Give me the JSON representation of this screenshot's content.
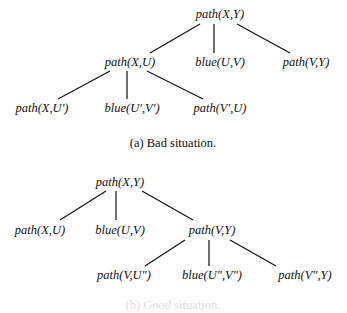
{
  "figures": [
    {
      "caption": "(a) Bad situation.",
      "nodes": [
        {
          "id": "a0",
          "label": "path(X,Y)",
          "x": 220,
          "y": 14
        },
        {
          "id": "a1",
          "label": "path(X,U)",
          "x": 130,
          "y": 62
        },
        {
          "id": "a2",
          "label": "blue(U,V)",
          "x": 220,
          "y": 62
        },
        {
          "id": "a3",
          "label": "path(V,Y)",
          "x": 306,
          "y": 62
        },
        {
          "id": "a4",
          "label": "path(X,U′)",
          "x": 42,
          "y": 108
        },
        {
          "id": "a5",
          "label": "blue(U′,V′)",
          "x": 132,
          "y": 108
        },
        {
          "id": "a6",
          "label": "path(V′,U)",
          "x": 220,
          "y": 108
        }
      ],
      "edges": [
        {
          "x1": 200,
          "y1": 24,
          "x2": 150,
          "y2": 53
        },
        {
          "x1": 214,
          "y1": 24,
          "x2": 214,
          "y2": 53
        },
        {
          "x1": 237,
          "y1": 24,
          "x2": 290,
          "y2": 53
        },
        {
          "x1": 110,
          "y1": 71,
          "x2": 58,
          "y2": 99
        },
        {
          "x1": 127,
          "y1": 71,
          "x2": 127,
          "y2": 99
        },
        {
          "x1": 147,
          "y1": 71,
          "x2": 203,
          "y2": 99
        }
      ],
      "caption_pos": {
        "x": 173,
        "y": 143
      }
    },
    {
      "caption": "(b) Good situation.",
      "nodes": [
        {
          "id": "b0",
          "label": "path(X,Y)",
          "x": 120,
          "y": 182
        },
        {
          "id": "b1",
          "label": "path(X,U)",
          "x": 40,
          "y": 230
        },
        {
          "id": "b2",
          "label": "blue(U,V)",
          "x": 120,
          "y": 230
        },
        {
          "id": "b3",
          "label": "path(V,Y)",
          "x": 212,
          "y": 230
        },
        {
          "id": "b4",
          "label": "path(V,U″)",
          "x": 124,
          "y": 275
        },
        {
          "id": "b5",
          "label": "blue(U″,V″)",
          "x": 212,
          "y": 275
        },
        {
          "id": "b6",
          "label": "path(V″,Y)",
          "x": 305,
          "y": 275
        }
      ],
      "edges": [
        {
          "x1": 106,
          "y1": 191,
          "x2": 60,
          "y2": 220
        },
        {
          "x1": 116,
          "y1": 191,
          "x2": 116,
          "y2": 220
        },
        {
          "x1": 142,
          "y1": 191,
          "x2": 193,
          "y2": 220
        },
        {
          "x1": 185,
          "y1": 240,
          "x2": 145,
          "y2": 266
        },
        {
          "x1": 209,
          "y1": 240,
          "x2": 209,
          "y2": 266
        },
        {
          "x1": 230,
          "y1": 240,
          "x2": 276,
          "y2": 266
        }
      ],
      "caption_pos": {
        "x": 173,
        "y": 305
      }
    }
  ]
}
